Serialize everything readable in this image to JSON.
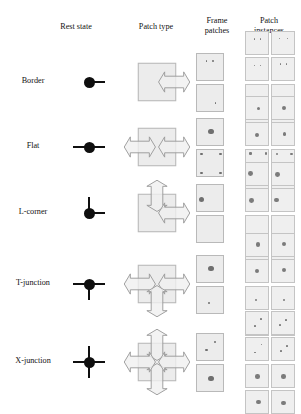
{
  "figure": {
    "headers": {
      "rest_state": "Rest state",
      "patch_type": "Patch type",
      "frame_patches_line1": "Frame",
      "frame_patches_line2": "patches",
      "patch_instances_line1": "Patch",
      "patch_instances_line2": "instances"
    },
    "colors": {
      "node": "#0f0f0f",
      "patch_fill": "#ececec",
      "patch_stroke": "#b9b9b9",
      "arrow_fill": "#f0f0f0",
      "arrow_stroke": "#9a9a9a",
      "dot": "#6f6f6f",
      "background": "#ffffff"
    },
    "rows": [
      {
        "label": "Border",
        "rest_arms": [
          "east"
        ],
        "patch_arrows": [
          "east"
        ],
        "frame_patches": [
          {
            "dots": [
              {
                "x": 34,
                "y": 26,
                "r": 3.4
              },
              {
                "x": 58,
                "y": 26,
                "r": 3.4
              }
            ]
          },
          {
            "dots": [
              {
                "x": 66,
                "y": 66,
                "r": 3.4
              }
            ]
          }
        ],
        "instance_groups": [
          {
            "count": 4,
            "dots": [
              {
                "x": 34,
                "y": 30,
                "r": 3.0
              },
              {
                "x": 62,
                "y": 30,
                "r": 3.0
              }
            ]
          },
          {
            "count": 4,
            "dots": [
              {
                "x": 62,
                "y": 66,
                "r": 3.0
              }
            ]
          }
        ]
      },
      {
        "label": "Flat",
        "rest_arms": [
          "east",
          "west"
        ],
        "patch_arrows": [
          "east",
          "west"
        ],
        "frame_patches": [
          {
            "dots": [
              {
                "x": 50,
                "y": 48,
                "r": 9.0
              }
            ]
          },
          {
            "dots": [
              {
                "x": 16,
                "y": 16,
                "r": 4.5
              },
              {
                "x": 84,
                "y": 16,
                "r": 4.5
              },
              {
                "x": 16,
                "y": 84,
                "r": 4.5
              },
              {
                "x": 84,
                "y": 84,
                "r": 4.5
              }
            ]
          }
        ],
        "instance_groups": [
          {
            "count": 4,
            "dots": [
              {
                "x": 50,
                "y": 50,
                "r": 8.0
              }
            ]
          },
          {
            "count": 4,
            "dots": [
              {
                "x": 18,
                "y": 18,
                "r": 4.5
              },
              {
                "x": 82,
                "y": 18,
                "r": 4.5
              },
              {
                "x": 18,
                "y": 82,
                "r": 4.5
              },
              {
                "x": 82,
                "y": 82,
                "r": 4.5
              }
            ]
          }
        ]
      },
      {
        "label": "L-corner",
        "rest_arms": [
          "north",
          "east"
        ],
        "patch_arrows": [
          "north",
          "east"
        ],
        "frame_patches": [
          {
            "dots": [
              {
                "x": 16,
                "y": 54,
                "r": 10.0
              }
            ]
          },
          {
            "dots": []
          }
        ],
        "instance_groups": [
          {
            "count": 4,
            "dots": [
              {
                "x": 22,
                "y": 50,
                "r": 10.0
              }
            ]
          },
          {
            "count": 4,
            "dots": []
          }
        ]
      },
      {
        "label": "T-junction",
        "rest_arms": [
          "west",
          "east",
          "south"
        ],
        "patch_arrows": [
          "west",
          "east",
          "south"
        ],
        "frame_patches": [
          {
            "dots": [
              {
                "x": 50,
                "y": 46,
                "r": 10.0
              }
            ]
          },
          {
            "dots": [
              {
                "x": 42,
                "y": 58,
                "r": 4.0
              }
            ]
          }
        ],
        "instance_groups": [
          {
            "count": 4,
            "dots": [
              {
                "x": 48,
                "y": 46,
                "r": 9.0
              }
            ]
          },
          {
            "count": 4,
            "dots": [
              {
                "x": 46,
                "y": 58,
                "r": 4.0
              }
            ]
          }
        ]
      },
      {
        "label": "X-junction",
        "rest_arms": [
          "north",
          "south",
          "east",
          "west"
        ],
        "patch_arrows": [
          "north",
          "south",
          "east",
          "west"
        ],
        "frame_patches": [
          {
            "dots": [
              {
                "x": 64,
                "y": 30,
                "r": 4.0
              },
              {
                "x": 34,
                "y": 58,
                "r": 4.0
              }
            ]
          },
          {
            "dots": [
              {
                "x": 50,
                "y": 50,
                "r": 10.0
              }
            ]
          }
        ],
        "instance_groups": [
          {
            "count": 4,
            "dots": [
              {
                "x": 62,
                "y": 32,
                "r": 3.6
              },
              {
                "x": 36,
                "y": 60,
                "r": 3.6
              }
            ]
          },
          {
            "count": 4,
            "dots": [
              {
                "x": 50,
                "y": 50,
                "r": 9.5
              }
            ]
          }
        ]
      }
    ]
  }
}
